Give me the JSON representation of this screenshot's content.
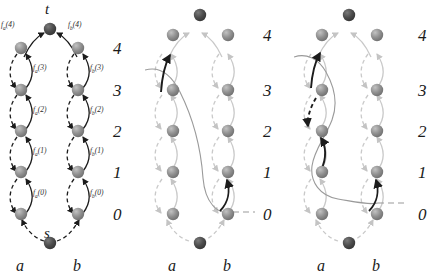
{
  "figure": {
    "title": "",
    "panels": [
      {
        "id": "panel-left",
        "terminals": {
          "top": "t",
          "bottom": "s"
        },
        "columns": {
          "a": "a",
          "b": "b"
        },
        "levels": [
          "4",
          "3",
          "2",
          "1",
          "0"
        ],
        "edge_labels_a": [
          "f_a(4)",
          "f_a(3)",
          "f_a(2)",
          "f_a(1)",
          "f_a(0)"
        ],
        "edge_labels_b": [
          "f_b(4)",
          "f_b(3)",
          "f_b(2)",
          "f_b(1)",
          "f_b(0)"
        ],
        "style": "full-contrast"
      },
      {
        "id": "panel-middle",
        "terminals": {
          "top": "",
          "bottom": ""
        },
        "columns": {
          "a": "a",
          "b": "b"
        },
        "levels": [
          "4",
          "3",
          "2",
          "1",
          "0"
        ],
        "highlighted_edges": [
          "a0-to-a4",
          "b0-to-b1"
        ],
        "style": "faded-with-2-highlights"
      },
      {
        "id": "panel-right",
        "terminals": {
          "top": "",
          "bottom": ""
        },
        "columns": {
          "a": "a",
          "b": "b"
        },
        "levels": [
          "4",
          "3",
          "2",
          "1",
          "0"
        ],
        "highlighted_edges": [
          "a3-to-a4",
          "a3-to-a2",
          "a1-to-a2",
          "b0-to-b1"
        ],
        "style": "faded-with-4-highlights"
      }
    ],
    "colors": {
      "node_light": "#8d8d8d",
      "node_dark": "#4a4a4a",
      "edge_dark": "#1c1c1c",
      "edge_faded": "#c9c9c9",
      "edge_mid": "#9a9a9a",
      "text": "#1a1a1a"
    }
  }
}
